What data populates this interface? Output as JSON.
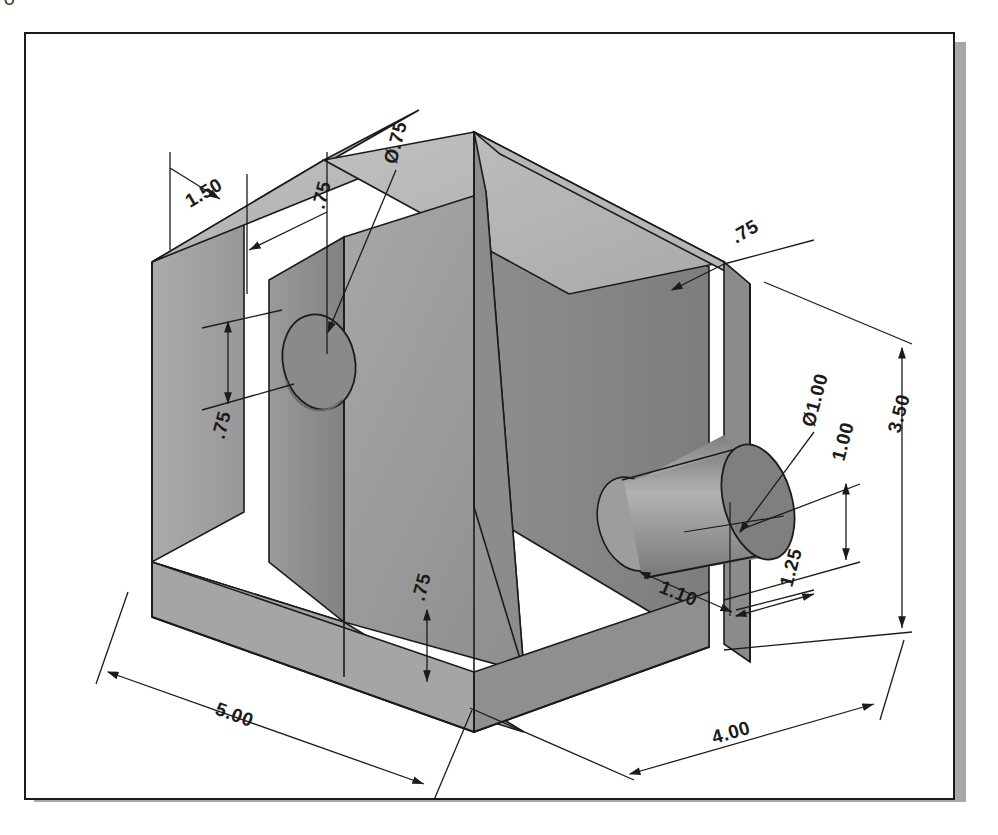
{
  "page": {
    "background_color": "#ffffff",
    "corner_glyph": "∪"
  },
  "frame": {
    "border_color": "#1b1b1b",
    "shadow_color": "#a8a8a8",
    "fill_color": "#ffffff"
  },
  "drawing": {
    "title": "Isometric dimensioned solid model",
    "units_note": "",
    "line_color": "#1b1b1b",
    "faces": {
      "top_face_color": "#b4b4b4",
      "left_face_color": "#a0a0a0",
      "right_face_color": "#8a8a8a",
      "ramp_face_color": "#9a9a9a",
      "inner_wall_color": "#8f8f8f",
      "cylinder_body_color": "#9e9e9e",
      "cylinder_cap_color": "#7f7f7f",
      "dark_shade_color": "#6f6f6f"
    }
  },
  "dimensions": [
    {
      "id": "depth-top-left",
      "label": "1.50",
      "rotation": -30
    },
    {
      "id": "wall-thickness-top",
      "label": ".75",
      "rotation": -75
    },
    {
      "id": "hole-diameter-top",
      "label": "Ø.75",
      "rotation": -75
    },
    {
      "id": "hole-height-left",
      "label": ".75",
      "rotation": -75
    },
    {
      "id": "rib-width-top-right",
      "label": ".75",
      "rotation": -30
    },
    {
      "id": "base-thickness-front",
      "label": ".75",
      "rotation": -75
    },
    {
      "id": "overall-length",
      "label": "5.00",
      "rotation": 30
    },
    {
      "id": "boss-diameter",
      "label": "Ø1.00",
      "rotation": -75
    },
    {
      "id": "boss-center-height",
      "label": "1.00",
      "rotation": -75
    },
    {
      "id": "overall-height",
      "label": "3.50",
      "rotation": -75
    },
    {
      "id": "boss-offset-front",
      "label": "1.10",
      "rotation": 30
    },
    {
      "id": "boss-offset-right",
      "label": "1.25",
      "rotation": -75
    },
    {
      "id": "overall-width",
      "label": "4.00",
      "rotation": 30
    }
  ]
}
